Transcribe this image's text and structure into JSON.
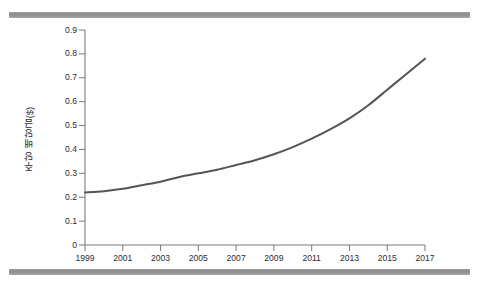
{
  "page": {
    "background_color": "#fefefe",
    "scan_bar_color": "#949494"
  },
  "chart_data": {
    "type": "line",
    "title": "",
    "subtitle": "",
    "xlabel": "",
    "ylabel": "주당 배당금($)",
    "xlim": [
      1999,
      2017
    ],
    "ylim": [
      0,
      0.9
    ],
    "grid": false,
    "legend": null,
    "line_color": "#555555",
    "line_width": 2.0,
    "axis_color": "#7b7b7b",
    "tick_label_color": "#2e2e2e",
    "xtick_labels": [
      "1999",
      "2001",
      "2003",
      "2005",
      "2007",
      "2009",
      "2011",
      "2013",
      "2015",
      "2017"
    ],
    "xtick_values": [
      1999,
      2001,
      2003,
      2005,
      2007,
      2009,
      2011,
      2013,
      2015,
      2017
    ],
    "ytick_labels": [
      "0",
      "0.1",
      "0.2",
      "0.3",
      "0.4",
      "0.5",
      "0.6",
      "0.7",
      "0.8",
      "0.9"
    ],
    "ytick_values": [
      0,
      0.1,
      0.2,
      0.3,
      0.4,
      0.5,
      0.6,
      0.7,
      0.8,
      0.9
    ],
    "x": [
      1999,
      2000,
      2001,
      2002,
      2003,
      2004,
      2005,
      2006,
      2007,
      2008,
      2009,
      2010,
      2011,
      2012,
      2013,
      2014,
      2015,
      2016,
      2017
    ],
    "values": [
      0.22,
      0.225,
      0.235,
      0.25,
      0.265,
      0.285,
      0.3,
      0.315,
      0.335,
      0.355,
      0.38,
      0.41,
      0.445,
      0.485,
      0.53,
      0.585,
      0.65,
      0.715,
      0.78
    ],
    "series": [
      {
        "name": "주당 배당금($)",
        "values": [
          0.22,
          0.225,
          0.235,
          0.25,
          0.265,
          0.285,
          0.3,
          0.315,
          0.335,
          0.355,
          0.38,
          0.41,
          0.445,
          0.485,
          0.53,
          0.585,
          0.65,
          0.715,
          0.78
        ]
      }
    ]
  }
}
